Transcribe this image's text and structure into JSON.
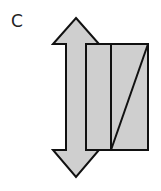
{
  "figure": {
    "label": "C",
    "colors": {
      "fill": "#cfcfcf",
      "stroke": "#111111",
      "background": "#ffffff"
    },
    "elements": [
      {
        "type": "double-arrow",
        "orientation": "vertical"
      },
      {
        "type": "rectangle",
        "divided_into": 2
      },
      {
        "type": "diagonal-line",
        "in": "right-panel"
      }
    ]
  }
}
